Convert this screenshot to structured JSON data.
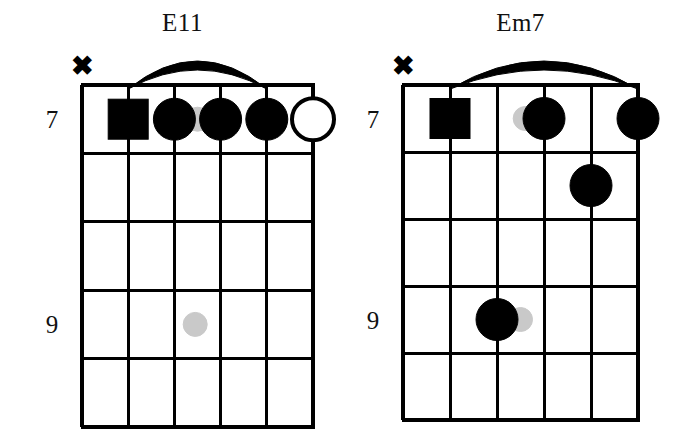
{
  "page": {
    "kind": "guitar-chord-chart",
    "width": 694,
    "height": 447,
    "background_color": "#ffffff",
    "ink_color": "#000000",
    "ghost_note_color": "#c9c9c9"
  },
  "chart_data": {
    "type": "diagram",
    "title": "",
    "diagram_kind": "guitar-chord-grid",
    "strings": 6,
    "frets": 5,
    "diagrams": [
      {
        "name": "E11",
        "mute_marker": "✖",
        "muted_string": 1,
        "fret_labels": [
          {
            "text": "7",
            "fret": 1
          },
          {
            "text": "9",
            "fret": 4
          }
        ],
        "barre": {
          "fret": 1,
          "from_string": 2,
          "to_string": 5
        },
        "markers": [
          {
            "string": 2,
            "fret": 1,
            "shape": "square",
            "fill": "black"
          },
          {
            "string": 3,
            "fret": 1,
            "shape": "circle",
            "fill": "black"
          },
          {
            "string": 4,
            "fret": 1,
            "shape": "circle",
            "fill": "black"
          },
          {
            "string": 5,
            "fret": 1,
            "shape": "circle",
            "fill": "black"
          },
          {
            "string": 6,
            "fret": 1,
            "shape": "circle",
            "fill": "open"
          },
          {
            "string": 3.5,
            "fret": 1,
            "shape": "circle",
            "fill": "gray"
          },
          {
            "string": 3.45,
            "fret": 4,
            "shape": "circle",
            "fill": "gray"
          }
        ]
      },
      {
        "name": "Em7",
        "mute_marker": "✖",
        "muted_string": 1,
        "fret_labels": [
          {
            "text": "7",
            "fret": 1
          },
          {
            "text": "9",
            "fret": 4
          }
        ],
        "barre": {
          "fret": 1,
          "from_string": 2,
          "to_string": 6
        },
        "markers": [
          {
            "string": 2,
            "fret": 1,
            "shape": "square",
            "fill": "black"
          },
          {
            "string": 3.6,
            "fret": 1,
            "shape": "circle",
            "fill": "gray"
          },
          {
            "string": 4,
            "fret": 1,
            "shape": "circle",
            "fill": "black"
          },
          {
            "string": 6,
            "fret": 1,
            "shape": "circle",
            "fill": "black"
          },
          {
            "string": 5,
            "fret": 2,
            "shape": "circle",
            "fill": "black"
          },
          {
            "string": 3,
            "fret": 4,
            "shape": "circle",
            "fill": "black"
          },
          {
            "string": 3.5,
            "fret": 4,
            "shape": "circle",
            "fill": "gray"
          }
        ]
      }
    ]
  },
  "geometry": {
    "0": {
      "grid_left": 82,
      "grid_top": 85,
      "string_gap": 46.2,
      "fret_gap": 68.4,
      "label_x": 52,
      "mute_x": 82,
      "mute_y": 75
    },
    "1": {
      "grid_left": 56,
      "grid_top": 85,
      "string_gap": 47.0,
      "fret_gap": 67.0,
      "label_x": 26,
      "mute_x": 56,
      "mute_y": 75
    }
  }
}
